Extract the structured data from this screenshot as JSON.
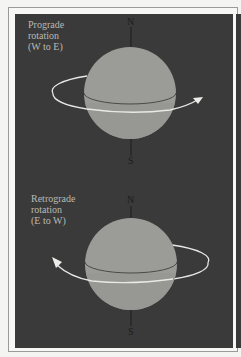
{
  "colors": {
    "page_background": "#f4f4f2",
    "frame_border": "#9a9a9a",
    "panel_background": "#3a3a3a",
    "globe_fill": "#9b9b98",
    "globe_lower_fill": "#999996",
    "equator_line": "#4a4a48",
    "orbit_line": "#e8e8e6",
    "axis_line": "#1c1c1c",
    "label_text": "#b9b9b4"
  },
  "panels": [
    {
      "id": "prograde",
      "label_lines": [
        "Prograde",
        "rotation",
        "(W to E)"
      ],
      "north_label": "N",
      "south_label": "S",
      "arrow_direction": "right"
    },
    {
      "id": "retrograde",
      "label_lines": [
        "Retrograde",
        "rotation",
        "(E to W)"
      ],
      "north_label": "N",
      "south_label": "S",
      "arrow_direction": "left"
    }
  ]
}
